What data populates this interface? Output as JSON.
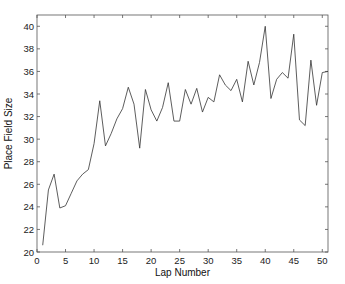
{
  "chart_data": {
    "type": "line",
    "title": "",
    "xlabel": "Lap Number",
    "ylabel": "Place Field Size",
    "xlim": [
      0,
      51
    ],
    "ylim": [
      20,
      41
    ],
    "xticks": [
      0,
      5,
      10,
      15,
      20,
      25,
      30,
      35,
      40,
      45,
      50
    ],
    "yticks": [
      20,
      22,
      24,
      26,
      28,
      30,
      32,
      34,
      36,
      38,
      40
    ],
    "grid": false,
    "legend": null,
    "series": [
      {
        "name": "Place Field Size",
        "color": "#333333",
        "x": [
          1,
          2,
          3,
          4,
          5,
          6,
          7,
          8,
          9,
          10,
          11,
          12,
          13,
          14,
          15,
          16,
          17,
          18,
          19,
          20,
          21,
          22,
          23,
          24,
          25,
          26,
          27,
          28,
          29,
          30,
          31,
          32,
          33,
          34,
          35,
          36,
          37,
          38,
          39,
          40,
          41,
          42,
          43,
          44,
          45,
          46,
          47,
          48,
          49,
          50,
          51
        ],
        "values": [
          20.6,
          25.5,
          26.9,
          23.9,
          24.1,
          25.2,
          26.3,
          26.9,
          27.3,
          29.6,
          33.4,
          29.4,
          30.5,
          31.8,
          32.7,
          34.6,
          33.1,
          29.2,
          34.4,
          32.6,
          31.6,
          32.8,
          35.0,
          31.6,
          31.6,
          34.4,
          33.1,
          34.5,
          32.4,
          33.7,
          33.3,
          35.7,
          34.8,
          34.3,
          35.3,
          33.3,
          36.9,
          34.8,
          36.8,
          40.0,
          33.6,
          35.3,
          35.9,
          35.4,
          39.3,
          31.7,
          31.2,
          37.0,
          33.0,
          35.9,
          36.0
        ]
      }
    ]
  },
  "plot_area": {
    "left": 37,
    "right": 328,
    "top": 15,
    "bottom": 252
  },
  "colors": {
    "axis": "#555555",
    "line": "#333333",
    "background": "#ffffff"
  }
}
